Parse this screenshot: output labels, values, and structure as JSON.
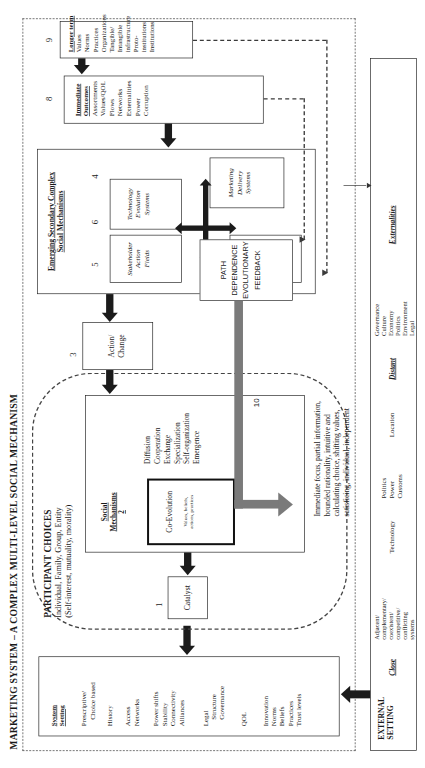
{
  "diagram": {
    "title": "MARKETING SYSTEM – A COMPLEX MULTI-LEVEL SOCIAL MECHANISM"
  },
  "external_setting": {
    "heading_line1": "EXTERNAL",
    "heading_line2": "SETTING",
    "close_label": "Close",
    "close_items": [
      "Adjacent/",
      "complementary/",
      "coexistent/",
      "competitive/",
      "conflicting",
      "systems"
    ],
    "technology": "Technology",
    "politics_group": [
      "Politics",
      "Power",
      "Customs"
    ],
    "location": "Location",
    "distant_label": "Distant",
    "distant_items": [
      "Governance",
      "Culture",
      "Economy",
      "Politics",
      "Environment",
      "Legal"
    ],
    "externalities_label": "Externalities"
  },
  "system_setting": {
    "heading_line1": "System",
    "heading_line2": "Setting",
    "group1": [
      "Prescriptive/",
      "Choice based"
    ],
    "group2": [
      "History"
    ],
    "group3": [
      "Access",
      "Networks"
    ],
    "group4": [
      "Power shifts",
      "Stability",
      "Connectivity",
      "Alliances"
    ],
    "group5": [
      "Legal",
      "Structure",
      "Governance"
    ],
    "group6": [
      "QOL"
    ],
    "group7": [
      "Innovation",
      "Norms",
      "Beliefs",
      "Practices",
      "Trust levels"
    ]
  },
  "participant_choices": {
    "heading": "PARTICIPANT CHOICES",
    "subheading1": "Individual, Family, Group, Entity",
    "subheading2": "(Self-interest, mutuality, morality)",
    "catalyst": "Catalyst",
    "catalyst_number": "1",
    "social_mechanisms_title1": "Social",
    "social_mechanisms_title2": "Mechanisms",
    "social_mechanisms_number": "2",
    "coevolution_title": "Co-Evolution",
    "coevolution_sub1": "Values, beliefs,",
    "coevolution_sub2": "actions, practices",
    "mechanism_list": [
      "Diffusion",
      "Cooperation",
      "Exchange",
      "Specialization",
      "Self-organization",
      "Emergence"
    ],
    "action_change_line1": "Action/",
    "action_change_line2": "Change",
    "action_change_number": "3",
    "footnote": [
      "Immediate focus, partial information,",
      "bounded rationality, intuitive and",
      "calculating choice, shifting values,",
      "satisficing, individual, independent"
    ]
  },
  "secondary_mechanisms": {
    "title_line1": "Emerging Secondary Complex",
    "title_line2": "Social Mechanisms",
    "stakeholder_action_fields": [
      "Stakeholder",
      "Action",
      "Fields"
    ],
    "stakeholder_number": "5",
    "technology_evolution_systems": [
      "Technology",
      "Evolution",
      "Systems"
    ],
    "technology_number": "6",
    "value_exchange_fields": [
      "Value",
      "Exchange",
      "Fields"
    ],
    "value_number": "7",
    "marketing_delivery_systems": [
      "Marketing",
      "Delivery",
      "Systems"
    ],
    "marketing_number": "4"
  },
  "immediate_outcomes": {
    "title_line1": "Immediate",
    "title_line2": "Outcomes",
    "number": "8",
    "items": [
      "Assortments",
      "Values/QOL",
      "Flows",
      "Networks",
      "Externalities",
      "Power",
      "Corruption"
    ]
  },
  "longer_term": {
    "title": "Longer term",
    "number": "9",
    "items": [
      "Values",
      "Norms",
      "Practices",
      "Organizations",
      "Tangible/",
      "Intangible",
      "infrastructure",
      "Proto-",
      "institutions",
      "Institutions"
    ]
  },
  "feedback": {
    "lines": [
      "PATH",
      "DEPENDENCE",
      "EVOLUTIONARY",
      "FEEDBACK"
    ],
    "loop_number": "10"
  },
  "colors": {
    "ink": "#1a1a1a",
    "arrow": "#1b1b1b",
    "grey_feedback": "#7a7a7a",
    "dash": "#333333"
  }
}
